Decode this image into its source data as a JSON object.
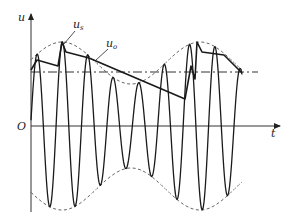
{
  "figure": {
    "axis_labels": {
      "y": "u",
      "x": "t",
      "origin": "O"
    },
    "curve_labels": {
      "input": {
        "base": "u",
        "sub": "s"
      },
      "output": {
        "base": "u",
        "sub": "o"
      }
    },
    "colors": {
      "line": "#1a1a1a",
      "envelope": "#555555",
      "axis": "#333333"
    },
    "geometry": {
      "origin": [
        31,
        126
      ],
      "y_axis_top": 14,
      "y_axis_bottom": 212,
      "x_axis_right": 280,
      "dc_level_y": 72,
      "dc_line_end_x": 258,
      "carrier_x_start": 31,
      "carrier_x_end": 242,
      "carrier_periods": 8.3,
      "envelope_x_end": 242
    },
    "output_trace": [
      [
        31,
        70
      ],
      [
        37,
        60
      ],
      [
        58,
        66
      ],
      [
        62,
        42
      ],
      [
        66,
        52
      ],
      [
        89,
        58
      ],
      [
        185,
        99
      ],
      [
        191,
        66
      ],
      [
        195,
        79
      ],
      [
        197,
        42
      ],
      [
        202,
        52
      ],
      [
        224,
        55
      ],
      [
        242,
        73
      ]
    ]
  }
}
